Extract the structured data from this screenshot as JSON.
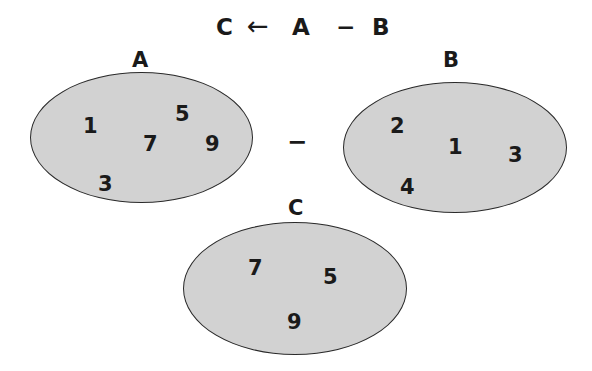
{
  "equation": {
    "result": "C",
    "arrow": "←",
    "left_operand": "A",
    "operator": "−",
    "right_operand": "B"
  },
  "sets": {
    "A": {
      "label": "A",
      "elements": [
        "1",
        "5",
        "7",
        "9",
        "3"
      ]
    },
    "B": {
      "label": "B",
      "elements": [
        "2",
        "1",
        "3",
        "4"
      ]
    },
    "C": {
      "label": "C",
      "elements": [
        "7",
        "5",
        "9"
      ]
    }
  },
  "between_operator": "−",
  "colors": {
    "fill": "#d2d2d2",
    "stroke": "#2a2a2a",
    "text": "#1a1a1a"
  }
}
